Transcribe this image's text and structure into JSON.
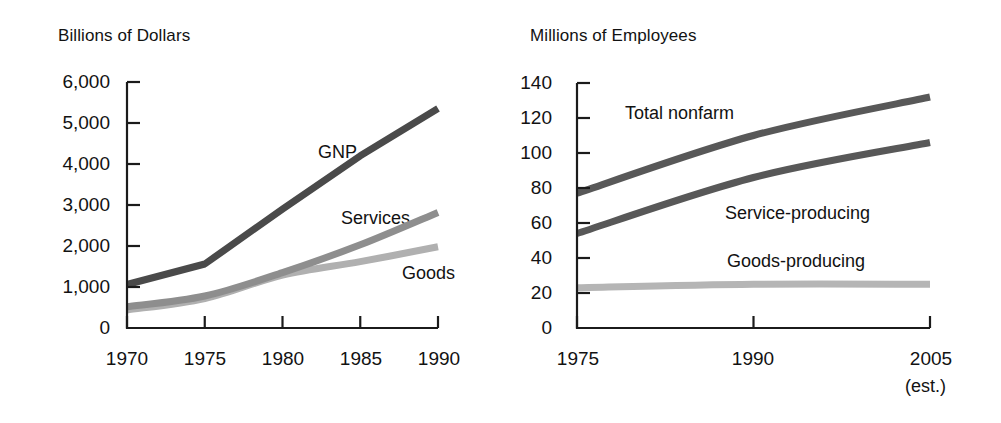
{
  "figure": {
    "background": "#ffffff",
    "text_color": "#121212"
  },
  "chart_data": [
    {
      "type": "line",
      "title": "Billions of Dollars",
      "panel": "left",
      "xlabel": "",
      "ylabel": "Billions of Dollars",
      "xlim": [
        1970,
        1990
      ],
      "ylim": [
        0,
        6000
      ],
      "grid": false,
      "legend_position": "inline-annotations",
      "xticks": [
        "1970",
        "1975",
        "1980",
        "1985",
        "1990"
      ],
      "xtick_values": [
        1970,
        1975,
        1980,
        1985,
        1990
      ],
      "yticks": [
        "0",
        "1,000",
        "2,000",
        "3,000",
        "4,000",
        "5,000",
        "6,000"
      ],
      "ytick_values": [
        0,
        1000,
        2000,
        3000,
        4000,
        5000,
        6000
      ],
      "x": [
        1970,
        1975,
        1980,
        1985,
        1990
      ],
      "series": [
        {
          "name": "GNP",
          "color": "#4a4a4a",
          "label_text": "GNP",
          "values": [
            1060,
            1560,
            2900,
            4200,
            5350
          ]
        },
        {
          "name": "Services",
          "color": "#8e8e8e",
          "label_text": "Services",
          "values": [
            520,
            780,
            1350,
            2030,
            2820
          ]
        },
        {
          "name": "Goods",
          "color": "#b0b0b0",
          "label_text": "Goods",
          "values": [
            440,
            720,
            1290,
            1620,
            1980
          ]
        }
      ]
    },
    {
      "type": "line",
      "title": "Millions of Employees",
      "panel": "right",
      "xlabel": "",
      "ylabel": "Millions of Employees",
      "xlim": [
        1975,
        2005
      ],
      "ylim": [
        0,
        140
      ],
      "grid": false,
      "legend_position": "inline-annotations",
      "xticks": [
        "1975",
        "1990",
        "2005"
      ],
      "xtick_values": [
        1975,
        1990,
        2005
      ],
      "xtick_note": "(est.)",
      "yticks": [
        "0",
        "20",
        "40",
        "60",
        "80",
        "100",
        "120",
        "140"
      ],
      "ytick_values": [
        0,
        20,
        40,
        60,
        80,
        100,
        120,
        140
      ],
      "x": [
        1975,
        1990,
        2005
      ],
      "series": [
        {
          "name": "Total nonfarm",
          "color": "#585858",
          "label_text": "Total nonfarm",
          "values": [
            77,
            110,
            132
          ]
        },
        {
          "name": "Service-producing",
          "color": "#585858",
          "label_text": "Service-producing",
          "values": [
            54,
            86,
            106
          ]
        },
        {
          "name": "Goods-producing",
          "color": "#b5b5b5",
          "label_text": "Goods-producing",
          "values": [
            23,
            25,
            25
          ]
        }
      ]
    }
  ],
  "left_chart": {
    "title": "Billions of Dollars",
    "ytick_labels": [
      "6,000",
      "5,000",
      "4,000",
      "3,000",
      "2,000",
      "1,000",
      "0"
    ],
    "xtick_labels": [
      "1970",
      "1975",
      "1980",
      "1985",
      "1990"
    ],
    "series_labels": [
      "GNP",
      "Services",
      "Goods"
    ]
  },
  "right_chart": {
    "title": "Millions of Employees",
    "ytick_labels": [
      "140",
      "120",
      "100",
      "80",
      "60",
      "40",
      "20",
      "0"
    ],
    "xtick_labels": [
      "1975",
      "1990",
      "2005"
    ],
    "xtick_note": "(est.)",
    "series_labels": [
      "Total nonfarm",
      "Service-producing",
      "Goods-producing"
    ]
  }
}
